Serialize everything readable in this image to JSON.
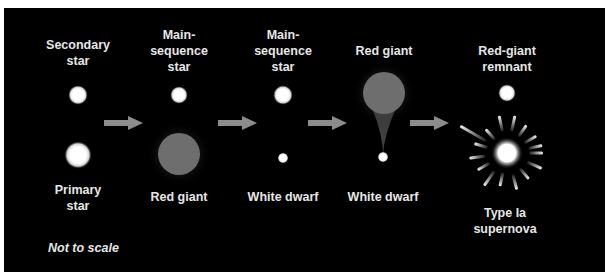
{
  "figure": {
    "background": "#000000",
    "note": "Not to scale",
    "stages": [
      {
        "top_label": "Secondary\nstar",
        "bottom_label": "Primary\nstar"
      },
      {
        "top_label": "Main-\nsequence\nstar",
        "bottom_label": "Red giant"
      },
      {
        "top_label": "Main-\nsequence\nstar",
        "bottom_label": "White dwarf"
      },
      {
        "top_label": "Red giant",
        "bottom_label": "White dwarf"
      },
      {
        "top_label": "Red-giant\nremnant",
        "bottom_label": "Type Ia\nsupernova"
      }
    ],
    "arrows": 4,
    "colors": {
      "star": "#ffffff",
      "red_giant": "#6e6e6e",
      "arrow": "#8c8c8c",
      "text": "#e6e6e6"
    }
  }
}
